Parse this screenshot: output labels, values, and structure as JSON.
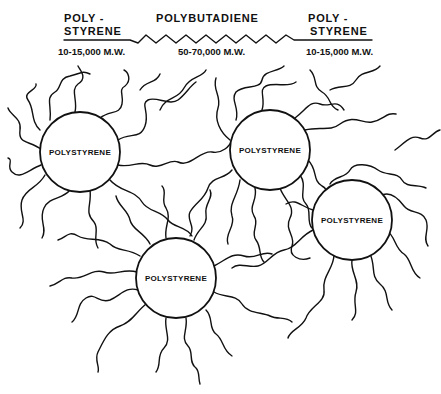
{
  "figure": {
    "header_cut_off": "",
    "block_copolymer_schematic": {
      "segments": [
        {
          "name_line1": "POLY -",
          "name_line2": "STYRENE",
          "molecular_weight": "10-15,000 M.W."
        },
        {
          "name_line1": "POLYBUTADIENE",
          "name_line2": "",
          "molecular_weight": "50-70,000 M.W."
        },
        {
          "name_line1": "POLY -",
          "name_line2": "STYRENE",
          "molecular_weight": "10-15,000 M.W."
        }
      ]
    },
    "domains": [
      {
        "label": "POLYSTYRENE",
        "cx": 80,
        "cy": 152,
        "r": 40
      },
      {
        "label": "POLYSTYRENE",
        "cx": 270,
        "cy": 150,
        "r": 40
      },
      {
        "label": "POLYSTYRENE",
        "cx": 352,
        "cy": 220,
        "r": 40
      },
      {
        "label": "POLYSTYRENE",
        "cx": 176,
        "cy": 278,
        "r": 40
      }
    ],
    "matrix_chains_description": "Polybutadiene chains (wavy lines) connecting polystyrene domains",
    "colors": {
      "ink": "#111111",
      "background": "#ffffff"
    }
  }
}
